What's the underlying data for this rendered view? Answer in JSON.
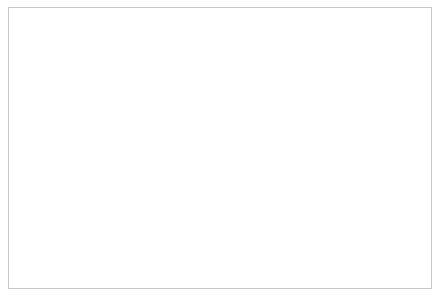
{
  "figure": {
    "border_color": "#c9c9c9",
    "background": "#ffffff"
  },
  "chart_data": {
    "type": "line",
    "title": "Deviance from controls",
    "xlabel": "Age in years",
    "ylabel": "",
    "xlim": [
      0,
      20
    ],
    "ylim": [
      -6,
      2
    ],
    "xticks": [
      0,
      5,
      10,
      15,
      20
    ],
    "xtick_labels": [
      "0",
      "5",
      "10",
      "15",
      "20"
    ],
    "yticks": [
      2,
      1,
      0,
      -1,
      -2,
      -3,
      -4,
      -5,
      -6
    ],
    "ytick_labels": [
      "2",
      "1",
      "0",
      "−1",
      "−2",
      "−3",
      "−4",
      "−5",
      "−6"
    ],
    "grid": false,
    "legend_position": "below",
    "zero_line": 0,
    "series": [
      {
        "name": "Difference",
        "type": "line",
        "color": "#555555",
        "marker": "x",
        "x": [
          0.2,
          1.0,
          4.0,
          6.0,
          8.3,
          11.0,
          13.1,
          15.0
        ],
        "values": [
          0.25,
          0.1,
          -0.6,
          -0.9,
          -0.75,
          -0.7,
          -1.0,
          -2.6
        ]
      },
      {
        "name": "95% confidence interval",
        "type": "band",
        "color": "#f2f2f2",
        "edge_color": "#dcdcdc",
        "x": [
          0.2,
          1.0,
          2.0,
          4.0,
          6.0,
          8.3,
          11.0,
          13.1,
          15.0
        ],
        "upper": [
          0.55,
          0.8,
          0.72,
          0.45,
          0.1,
          0.5,
          0.6,
          1.25,
          0.4
        ],
        "lower": [
          -0.1,
          -0.65,
          -0.9,
          -1.45,
          -1.9,
          -2.0,
          -2.05,
          -2.8,
          -5.6
        ]
      }
    ]
  },
  "legend": {
    "band_label": "95% confidence interval",
    "line_label": "Difference"
  },
  "colors": {
    "line": "#555555",
    "band_fill": "#f2f2f2",
    "band_edge": "#dcdcdc",
    "axis": "#333333",
    "text": "#1a1a1a"
  }
}
